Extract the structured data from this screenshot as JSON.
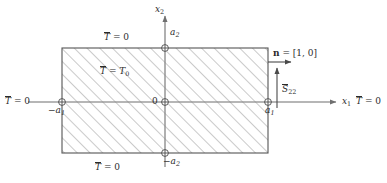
{
  "figure": {
    "type": "engineering-boundary-value-diagram",
    "colors": {
      "ink": "#2b2b2b",
      "axis": "#6f6f6f",
      "rect_edge": "#555555",
      "hatch": "#8a8a8a",
      "background": "#ffffff"
    },
    "axes": {
      "x_axis_label": "x",
      "x_axis_subscript": "1",
      "y_axis_label": "x",
      "y_axis_subscript": "2"
    },
    "origin_label": "0",
    "ticks": [
      {
        "name": "left-x1-tick",
        "text": "−a",
        "sub": "1"
      },
      {
        "name": "right-x1-tick",
        "text": "a",
        "sub": "1"
      },
      {
        "name": "top-x2-tick",
        "text": "a",
        "sub": "2"
      },
      {
        "name": "bottom-x2-tick",
        "text": "−a",
        "sub": "2"
      }
    ],
    "boundary_conditions": {
      "top": {
        "symbol": "T",
        "overbar": true,
        "relation": "=",
        "value": "0"
      },
      "bottom": {
        "symbol": "T",
        "overbar": true,
        "relation": "=",
        "value": "0"
      },
      "left": {
        "symbol": "T",
        "overbar": true,
        "relation": "=",
        "value": "0"
      },
      "right": {
        "symbol": "T",
        "overbar": true,
        "relation": "=",
        "value": "0"
      },
      "interior": {
        "symbol": "T",
        "overbar": true,
        "relation": "=",
        "value": "T",
        "value_sub": "0"
      }
    },
    "vectors": {
      "normal": {
        "symbol": "n",
        "relation": "=",
        "value": "[1, 0]",
        "direction": "right"
      },
      "stress": {
        "symbol": "S",
        "overbar": true,
        "subscript": "22",
        "direction": "up"
      }
    }
  }
}
